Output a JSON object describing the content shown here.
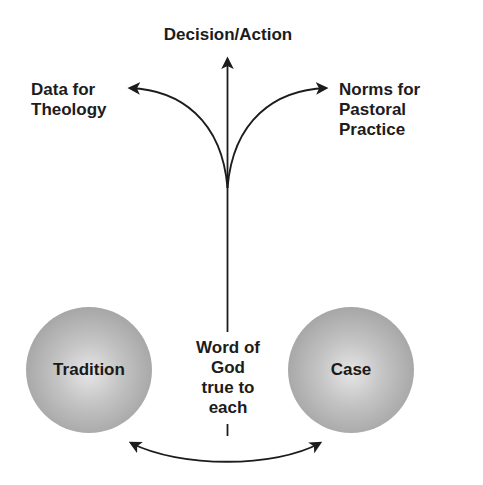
{
  "diagram": {
    "top_node": {
      "label": "Decision/Action"
    },
    "left_output": {
      "lines": [
        "Data for",
        "Theology"
      ]
    },
    "right_output": {
      "lines": [
        "Norms for",
        "Pastoral",
        "Practice"
      ]
    },
    "center_mediator": {
      "lines": [
        "Word of",
        "God",
        "true to",
        "each"
      ]
    },
    "left_circle": {
      "label": "Tradition"
    },
    "right_circle": {
      "label": "Case"
    },
    "colors": {
      "line": "#1c1c1c",
      "circle_light": "#e6e6e6",
      "circle_dark": "#979797",
      "background": "#ffffff"
    },
    "connections": [
      {
        "from": "center-stem",
        "to": "Decision/Action",
        "type": "arrow-up"
      },
      {
        "from": "center-stem",
        "to": "Data for Theology",
        "type": "curved-arrow-left"
      },
      {
        "from": "center-stem",
        "to": "Norms for Pastoral Practice",
        "type": "curved-arrow-right"
      },
      {
        "from": "Tradition",
        "to": "Case",
        "type": "double-headed-curved-arrow"
      }
    ]
  }
}
